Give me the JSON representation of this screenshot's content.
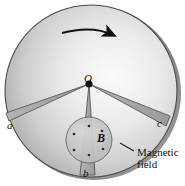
{
  "figure": {
    "type": "physics-diagram",
    "center_label": "O",
    "field_label": "B",
    "rim_labels": {
      "left": "a",
      "bottom": "b",
      "right": "c"
    },
    "callout": {
      "line1": "Magnetic",
      "line2": "field"
    },
    "rotation": {
      "icon": "curved-arrow-clockwise",
      "direction": "clockwise"
    },
    "field_direction": "out-of-page",
    "field_marker": "dot",
    "field_dot_count": 6
  },
  "colors": {
    "stroke": "#3a3a3a",
    "rim_dark": "#8c8c8c",
    "disk_light": "#f2f2f2",
    "disk_mid": "#cfcfcf",
    "disk_dark": "#9a9a9a",
    "wedge": "#a8a8a8",
    "field_region": "#c4c4c4",
    "text": "#111111",
    "background": "#ffffff"
  },
  "geometry": {
    "disk_center": {
      "x": 92,
      "y": 92
    },
    "disk_radius": 88,
    "hub": {
      "x": 89,
      "y": 84
    },
    "field_circle": {
      "x": 89,
      "y": 140,
      "r": 23
    }
  }
}
